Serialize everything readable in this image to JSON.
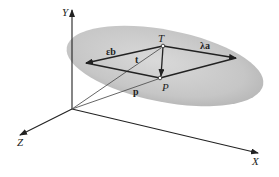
{
  "diagram": {
    "type": "3D vector geometry of a plane",
    "axes": {
      "y_label": "Y",
      "z_label": "Z",
      "x_label": "X"
    },
    "points": {
      "T": "T",
      "P": "P"
    },
    "vectors": {
      "eps_b": "εb",
      "lambda_a": "λa",
      "t": "t",
      "p": "p"
    },
    "colors": {
      "plane_fill": "#c8c8c8",
      "lines": "#222222",
      "ray_lines": "#9a9a9a"
    }
  }
}
